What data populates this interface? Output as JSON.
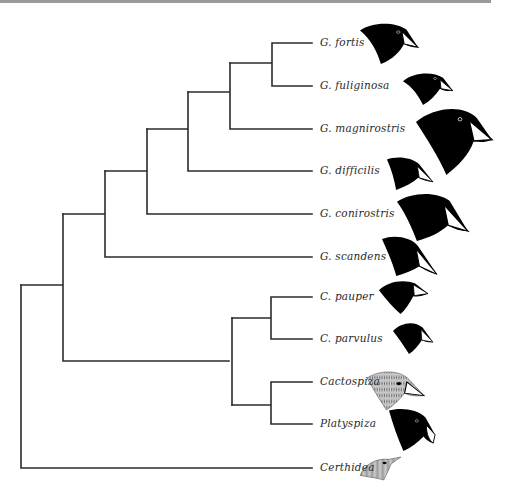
{
  "figure": {
    "type": "phylogenetic-tree"
  },
  "taxa": [
    {
      "name": "G. fortis",
      "y": 43,
      "head": {
        "x": 360,
        "y": 22,
        "w": 58,
        "h": 42,
        "style": "solid"
      }
    },
    {
      "name": "G. fuliginosa",
      "y": 86,
      "head": {
        "x": 403,
        "y": 71,
        "w": 50,
        "h": 34,
        "style": "solid"
      }
    },
    {
      "name": "G. magnirostris",
      "y": 128,
      "head": {
        "x": 416,
        "y": 107,
        "w": 76,
        "h": 68,
        "style": "solid"
      }
    },
    {
      "name": "G. difficilis",
      "y": 171,
      "head": {
        "x": 387,
        "y": 156,
        "w": 46,
        "h": 34,
        "style": "solid"
      }
    },
    {
      "name": "G. conirostris",
      "y": 214,
      "head": {
        "x": 397,
        "y": 192,
        "w": 71,
        "h": 49,
        "style": "solid"
      }
    },
    {
      "name": "G. scandens",
      "y": 257,
      "head": {
        "x": 382,
        "y": 235,
        "w": 55,
        "h": 41,
        "style": "solid"
      }
    },
    {
      "name": "C. pauper",
      "y": 297,
      "head": {
        "x": 379,
        "y": 280,
        "w": 49,
        "h": 34,
        "style": "solid"
      }
    },
    {
      "name": "C. parvulus",
      "y": 339,
      "head": {
        "x": 393,
        "y": 321,
        "w": 40,
        "h": 33,
        "style": "solid"
      }
    },
    {
      "name": "Cactospiza",
      "y": 382,
      "head": {
        "x": 367,
        "y": 370,
        "w": 57,
        "h": 40,
        "style": "stippled"
      }
    },
    {
      "name": "Platyspiza",
      "y": 424,
      "head": {
        "x": 389,
        "y": 408,
        "w": 48,
        "h": 43,
        "style": "solid"
      }
    },
    {
      "name": "Certhidea",
      "y": 468,
      "head": {
        "x": 360,
        "y": 457,
        "w": 41,
        "h": 23,
        "style": "stippled"
      }
    }
  ],
  "colors": {
    "branch": "#2b2b2b",
    "label": "#2a2a2a",
    "head_solid": "#000000",
    "head_stippled": "#8a8a8a",
    "top_rule": "#9a9a9a"
  }
}
